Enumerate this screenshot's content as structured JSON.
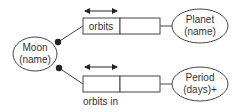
{
  "diagram": {
    "type": "object-role-model",
    "colors": {
      "stroke": "#444444",
      "text": "#333333",
      "dot": "#222222",
      "background": "#ffffff"
    },
    "entities": [
      {
        "id": "moon",
        "line1": "Moon",
        "line2": "(name)"
      },
      {
        "id": "planet",
        "line1": "Planet",
        "line2": "(name)"
      },
      {
        "id": "period",
        "line1": "Period",
        "line2": "(days)+"
      }
    ],
    "facts": [
      {
        "id": "orbits",
        "reading": "orbits",
        "reading_position": "inside-left-cell"
      },
      {
        "id": "orbits-in",
        "reading": "orbits in",
        "reading_position": "below"
      }
    ],
    "relationships": [
      {
        "from": "moon",
        "fact": "orbits",
        "to": "planet",
        "mandatory": true,
        "uniqueness": "left-role"
      },
      {
        "from": "moon",
        "fact": "orbits-in",
        "to": "period",
        "mandatory": true,
        "uniqueness": "left-role"
      }
    ]
  }
}
